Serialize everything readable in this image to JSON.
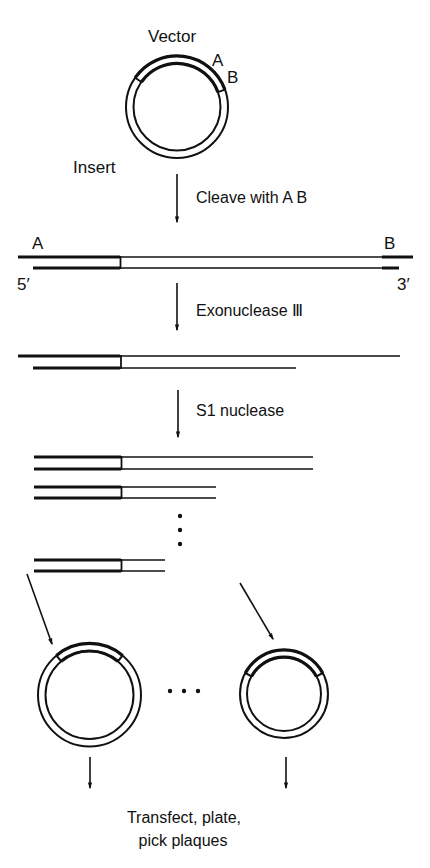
{
  "colors": {
    "ink": "#111111",
    "background": "#ffffff"
  },
  "labels": {
    "vector": "Vector",
    "site_a": "A",
    "site_b": "B",
    "insert": "Insert",
    "end_5": "5′",
    "end_3": "3′",
    "linear_site_a": "A",
    "linear_site_b": "B"
  },
  "steps": [
    {
      "label": "Cleave with A B"
    },
    {
      "label": "Exonuclease Ⅲ"
    },
    {
      "label": "S1 nuclease"
    }
  ],
  "final_step": {
    "line1": "Transfect, plate,",
    "line2": "pick plaques"
  },
  "ellipsis_vertical": "⋮",
  "ellipsis_horizontal": "…",
  "fragments": [
    {
      "name": "full-length",
      "end_x": 313
    },
    {
      "name": "shorter",
      "end_x": 216
    },
    {
      "name": "shortest",
      "end_x": 165
    }
  ]
}
